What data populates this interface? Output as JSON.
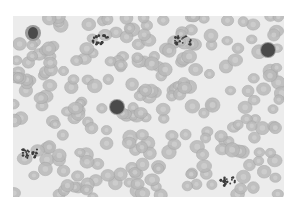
{
  "image": {
    "subject": "blood smear micrograph",
    "description": "Grayscale peripheral blood smear showing numerous red blood cells, several leukocytes and platelet clumps",
    "colors": {
      "background": "#ececec",
      "rbc_fill": "#b9b9b9",
      "rbc_center": "#d2d2d2",
      "rbc_edge": "#a4a4a4",
      "nucleus": "#4a4a4a",
      "platelet": "#3c3c3c"
    },
    "features": [
      {
        "type": "neutrophil",
        "x": 33,
        "y": 33
      },
      {
        "type": "platelet-clump",
        "x": 100,
        "y": 40
      },
      {
        "type": "platelet-clump",
        "x": 183,
        "y": 40
      },
      {
        "type": "lymphocyte",
        "x": 268,
        "y": 50
      },
      {
        "type": "monocyte",
        "x": 117,
        "y": 107
      },
      {
        "type": "platelet-clump",
        "x": 30,
        "y": 154
      },
      {
        "type": "platelet-clump",
        "x": 227,
        "y": 181
      }
    ]
  }
}
